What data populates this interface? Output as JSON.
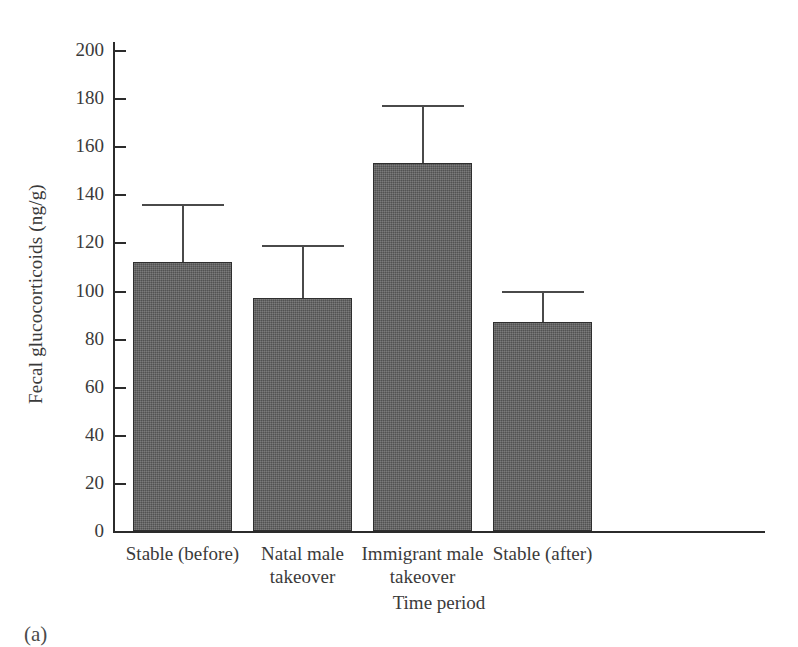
{
  "figure": {
    "panel_letter": "(a)"
  },
  "chart_data": {
    "type": "bar",
    "title": "",
    "xlabel": "Time period",
    "ylabel": "Fecal glucocorticoids (ng/g)",
    "categories": [
      "Stable (before)",
      "Natal male takeover",
      "Immigrant male takeover",
      "Stable (after)"
    ],
    "category_lines": [
      [
        "Stable (before)"
      ],
      [
        "Natal male",
        "takeover"
      ],
      [
        "Immigrant male",
        "takeover"
      ],
      [
        "Stable (after)"
      ]
    ],
    "values": [
      112,
      97,
      153,
      87
    ],
    "error_upper": [
      136,
      119,
      177,
      100
    ],
    "error_amount": [
      24,
      22,
      24,
      13
    ],
    "ylim": [
      0,
      200
    ],
    "yticks": [
      0,
      20,
      40,
      60,
      80,
      100,
      120,
      140,
      160,
      180,
      200
    ],
    "ytick_labels": [
      "0",
      "20",
      "40",
      "60",
      "80",
      "100",
      "120",
      "140",
      "160",
      "180",
      "200"
    ],
    "grid": false,
    "legend": null,
    "bar_color": "#5d5d5d",
    "axis_color": "#2b2b2b",
    "error_bar_color": "#4a4a4a",
    "error_bar_direction": "upper-only"
  }
}
